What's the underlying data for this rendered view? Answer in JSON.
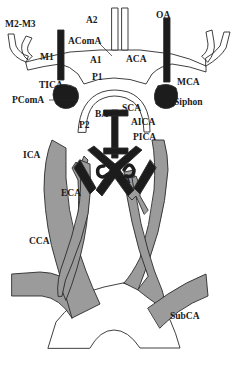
{
  "diagram": {
    "colors": {
      "vessel_gray": "#9b9b9b",
      "vessel_black": "#1c1c1c",
      "vessel_white": "#ffffff",
      "outline": "#2a2a2a",
      "background": "#ffffff"
    },
    "labels": {
      "m2m3": "M2-M3",
      "a2": "A2",
      "acoma": "AComA",
      "oa": "OA",
      "m1": "M1",
      "a1": "A1",
      "aca": "ACA",
      "tica": "TICA",
      "p1": "P1",
      "mca": "MCA",
      "pcoma": "PComA",
      "siphon": "Siphon",
      "sca": "SCA",
      "ba": "BA",
      "aica": "AICA",
      "p2": "P2",
      "pica": "PICA",
      "ica": "ICA",
      "eca": "ECA",
      "va": "VA",
      "cca": "CCA",
      "subca": "SubCA"
    }
  }
}
